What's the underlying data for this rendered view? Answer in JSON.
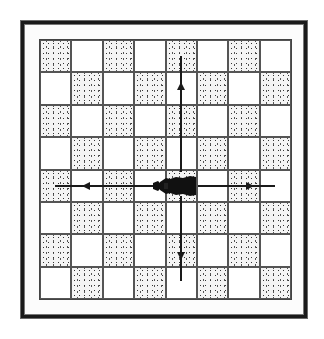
{
  "diagram": {
    "type": "chessboard-move-diagram",
    "board": {
      "rows": 8,
      "cols": 8,
      "first_square_dark": true
    },
    "piece": {
      "name": "rook",
      "color": "black",
      "row": 4,
      "col": 4
    },
    "moves": [
      {
        "direction": "up",
        "label": ""
      },
      {
        "direction": "down",
        "label": ""
      },
      {
        "direction": "left",
        "label": ""
      },
      {
        "direction": "right",
        "label": ""
      }
    ],
    "colors": {
      "frame": "#1a1a1a",
      "grid": "#555555",
      "stipple": "#333333",
      "arrow": "#1a1a1a",
      "piece": "#111111"
    }
  }
}
